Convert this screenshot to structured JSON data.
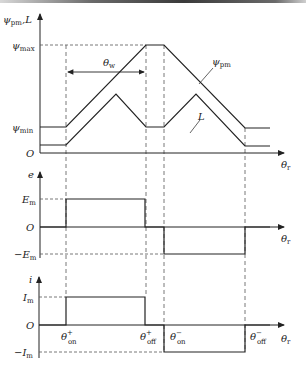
{
  "figure": {
    "top_panel": {
      "y_axis_label": "ψpm,L",
      "y_axis_label_main": "ψ",
      "y_axis_label_sub": "pm",
      "y_axis_label_suffix": ",L",
      "ticks": {
        "psi_max_main": "ψ",
        "psi_max_sub": "max",
        "psi_min_main": "ψ",
        "psi_min_sub": "min",
        "origin": "O"
      },
      "interval_label_main": "θ",
      "interval_label_sub": "w",
      "curve_labels": {
        "psi_pm_main": "ψ",
        "psi_pm_sub": "pm",
        "inductance": "L"
      },
      "x_axis_label_main": "θ",
      "x_axis_label_sub": "r"
    },
    "middle_panel": {
      "y_axis_label": "e",
      "ticks": {
        "em_pos_main": "E",
        "em_pos_sub": "m",
        "origin": "O",
        "em_neg_prefix": "−",
        "em_neg_main": "E",
        "em_neg_sub": "m"
      },
      "x_axis_label_main": "θ",
      "x_axis_label_sub": "r"
    },
    "bottom_panel": {
      "y_axis_label": "i",
      "ticks": {
        "im_pos_main": "I",
        "im_pos_sub": "m",
        "origin": "O",
        "im_neg_prefix": "−",
        "im_neg_main": "I",
        "im_neg_sub": "m"
      },
      "angle_labels": [
        {
          "main": "θ",
          "sup": "+",
          "sub": "on"
        },
        {
          "main": "θ",
          "sup": "+",
          "sub": "off"
        },
        {
          "main": "θ",
          "sup": "−",
          "sub": "on"
        },
        {
          "main": "θ",
          "sup": "−",
          "sub": "off"
        }
      ],
      "x_axis_label_main": "θ",
      "x_axis_label_sub": "r"
    }
  },
  "colors": {
    "line": "#222222",
    "dashed": "#555555",
    "topbar": "#3a3a3a"
  }
}
